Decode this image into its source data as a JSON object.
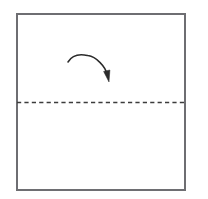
{
  "figure": {
    "kind": "origami-fold-diagram",
    "title": "Valley fold in half",
    "background_color": "#ffffff",
    "width": 208,
    "height": 199
  },
  "paper": {
    "label": "square paper sheet",
    "shape": "square",
    "x": 17,
    "y": 14,
    "width": 168,
    "height": 176,
    "stroke_color": "#6e6e72",
    "stroke_width": 1.6,
    "fill_color": "#ffffff"
  },
  "fold_line": {
    "label": "horizontal fold crease",
    "type": "dashed",
    "orientation": "horizontal",
    "x1": 17,
    "y1": 102.5,
    "x2": 185,
    "y2": 102.5,
    "stroke_color": "#3c3c3c",
    "stroke_width": 1.3,
    "dash_length": 4.2,
    "gap_length": 3.2
  },
  "fold_arrow": {
    "label": "fold direction arrow",
    "style": "curved",
    "direction": "clockwise",
    "start_x": 68,
    "start_y": 62,
    "apex_x": 88,
    "apex_y": 55,
    "end_x": 107,
    "end_y": 73,
    "tip_x": 109,
    "tip_y": 82,
    "stroke_color": "#2b2b2b",
    "stroke_width": 1.5,
    "head_fill": "#2b2b2b"
  }
}
